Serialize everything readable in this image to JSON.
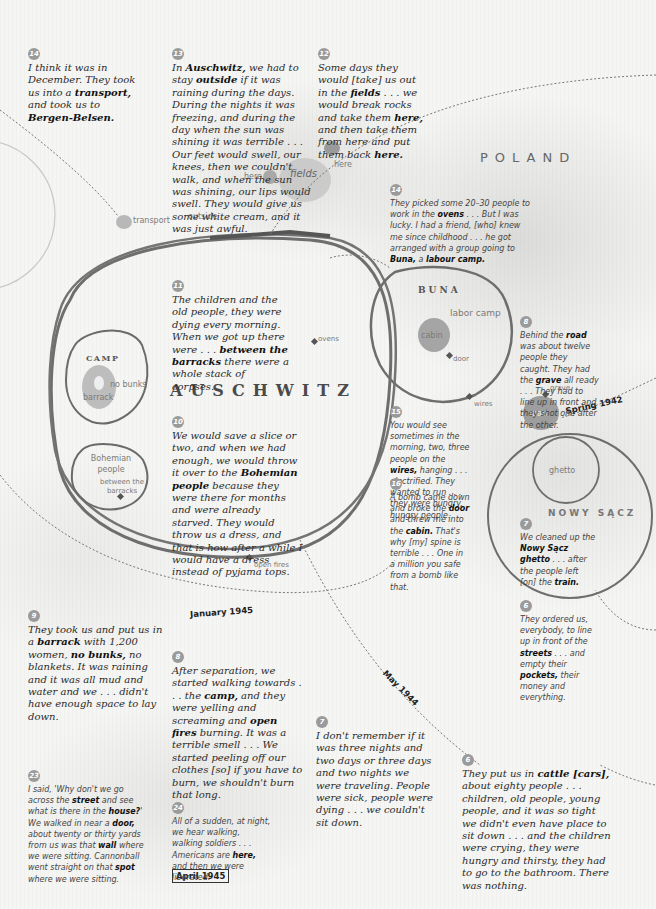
{
  "places": {
    "poland": "POLAND",
    "auschwitz": "AUSCHWITZ",
    "camp": "CAMP",
    "buna": "BUNA",
    "nowy_sacz": "NOWY SĄCZ"
  },
  "labels": {
    "transport": "transport",
    "outside": "outside",
    "here_1": "here",
    "here_2": "here",
    "fields": "fields",
    "labor_camp": "labor camp",
    "cabin": "cabin",
    "door": "door",
    "ovens": "ovens",
    "wires": "wires",
    "no_bunks": "no bunks",
    "barrack": "barrack",
    "bohemian_people": "Bohemian people",
    "between_the_barracks": "between the barracks",
    "open_fires": "open fires",
    "grave": "grave",
    "road": "road",
    "ghetto": "ghetto"
  },
  "dates": {
    "spring_1942": "Spring 1942",
    "may_1944": "May 1944",
    "january_1945": "January 1945",
    "april_1945": "April 1945"
  },
  "colors": {
    "background": "#f4f4f2",
    "ink": "#6e6e6e",
    "badge": "#9a9a9a",
    "text": "#2a2a2a"
  },
  "quotes": [
    {
      "id": "q14a",
      "number": "14",
      "style": "serif",
      "parts": [
        [
          "I think it was in December. They took us into a ",
          false
        ],
        [
          "transport,",
          true
        ],
        [
          " and took us to ",
          false
        ],
        [
          "Bergen-Belsen.",
          true
        ]
      ]
    },
    {
      "id": "q13",
      "number": "13",
      "style": "serif",
      "parts": [
        [
          "In ",
          false
        ],
        [
          "Auschwitz,",
          true
        ],
        [
          " we had to stay ",
          false
        ],
        [
          "outside",
          true
        ],
        [
          " if it was raining during the days. During the nights it was freezing, and during the day when the sun was shining it was terrible . . . Our feet would swell, our knees, then we couldn't walk, and when the sun was shining, our lips would swell. They would give us some white cream, and it was just awful.",
          false
        ]
      ]
    },
    {
      "id": "q12",
      "number": "12",
      "style": "serif",
      "parts": [
        [
          "Some days they would [take] us out in the ",
          false
        ],
        [
          "fields",
          true
        ],
        [
          " . . . we would break rocks and take them ",
          false
        ],
        [
          "here,",
          true
        ],
        [
          " and then take them from here and put them back ",
          false
        ],
        [
          "here.",
          true
        ]
      ]
    },
    {
      "id": "q14b",
      "number": "14",
      "style": "sans",
      "parts": [
        [
          "They picked some 20–30 people to work in the ",
          false
        ],
        [
          "ovens",
          true
        ],
        [
          " . . . But I was lucky. I had a friend, [who] knew me since childhood . . . he got arranged with a group going to ",
          false
        ],
        [
          "Buna,",
          true
        ],
        [
          " a ",
          false
        ],
        [
          "labour camp.",
          true
        ]
      ]
    },
    {
      "id": "q11",
      "number": "11",
      "style": "serif",
      "parts": [
        [
          "The children and the old people, they were dying every morning. When we got up there were . . . ",
          false
        ],
        [
          "between the barracks",
          true
        ],
        [
          " there were a whole stack of corpses.",
          false
        ]
      ]
    },
    {
      "id": "q8b",
      "number": "8",
      "style": "sans",
      "parts": [
        [
          "Behind the ",
          false
        ],
        [
          "road",
          true
        ],
        [
          " was about twelve people they caught. They had the ",
          false
        ],
        [
          "grave",
          true
        ],
        [
          " all ready . . . They had to line up in front and they shot one after the other.",
          false
        ]
      ]
    },
    {
      "id": "q10",
      "number": "10",
      "style": "serif",
      "parts": [
        [
          "We would save a slice or two, and when we had enough, we would throw it over to the ",
          false
        ],
        [
          "Bohemian people",
          true
        ],
        [
          " because they were there for months and were already starved. They would throw us a dress, and that is how after a while I would have a dress instead of pyjama tops.",
          false
        ]
      ]
    },
    {
      "id": "q15",
      "number": "15",
      "style": "sans",
      "parts": [
        [
          "You would see sometimes in the morning, two, three people on the ",
          false
        ],
        [
          "wires,",
          true
        ],
        [
          " hanging . . . electrified. They wanted to run . . . they were hungry, hungry people.",
          false
        ]
      ]
    },
    {
      "id": "q16",
      "number": "16",
      "style": "sans",
      "parts": [
        [
          "A bomb came down and broke the ",
          false
        ],
        [
          "door",
          true
        ],
        [
          " and threw me into the ",
          false
        ],
        [
          "cabin.",
          true
        ],
        [
          " That's why [my] spine is terrible . . . One in a million you safe from a bomb like that.",
          false
        ]
      ]
    },
    {
      "id": "q7b",
      "number": "7",
      "style": "sans",
      "parts": [
        [
          "We cleaned up the ",
          false
        ],
        [
          "Nowy Sącz ghetto",
          true
        ],
        [
          " . . . after the people left [on] the ",
          false
        ],
        [
          "train.",
          true
        ]
      ]
    },
    {
      "id": "q6b",
      "number": "6",
      "style": "sans",
      "parts": [
        [
          "They ordered us, everybody, to line up in front of the ",
          false
        ],
        [
          "streets",
          true
        ],
        [
          " . . . and empty their ",
          false
        ],
        [
          "pockets,",
          true
        ],
        [
          " their money and everything.",
          false
        ]
      ]
    },
    {
      "id": "q9",
      "number": "9",
      "style": "serif",
      "parts": [
        [
          "They took us and put us in a ",
          false
        ],
        [
          "barrack",
          true
        ],
        [
          " with 1,200 women, ",
          false
        ],
        [
          "no bunks,",
          true
        ],
        [
          " no blankets. It was raining and it was all mud and water and we . . . didn't have enough space to lay down.",
          false
        ]
      ]
    },
    {
      "id": "q8a",
      "number": "8",
      "style": "serif",
      "parts": [
        [
          "After separation, we started walking towards . . . the ",
          false
        ],
        [
          "camp,",
          true
        ],
        [
          " and they were yelling and screaming and ",
          false
        ],
        [
          "open fires",
          true
        ],
        [
          " burning. It was a terrible smell . . . We started peeling off our clothes [so] if you have to burn, we shouldn't burn that long.",
          false
        ]
      ]
    },
    {
      "id": "q7a",
      "number": "7",
      "style": "serif",
      "parts": [
        [
          "I don't remember if it was three nights and two days or three days and two nights we were traveling. People were sick, people were dying . . . we couldn't sit down.",
          false
        ]
      ]
    },
    {
      "id": "q6a",
      "number": "6",
      "style": "serif",
      "parts": [
        [
          "They put us in ",
          false
        ],
        [
          "cattle [cars],",
          true
        ],
        [
          " about eighty people . . . children, old people, young people, and it was so tight we didn't even have place to sit down . . . and the children were crying, they were hungry and thirsty, they had to go to the bathroom. There was nothing.",
          false
        ]
      ]
    },
    {
      "id": "q23",
      "number": "23",
      "style": "sans",
      "parts": [
        [
          "I said, 'Why don't we go across the ",
          false
        ],
        [
          "street",
          true
        ],
        [
          " and see what is there in the ",
          false
        ],
        [
          "house?",
          true
        ],
        [
          "' We walked in near a ",
          false
        ],
        [
          "door,",
          true
        ],
        [
          " about twenty or thirty yards from us was that ",
          false
        ],
        [
          "wall",
          true
        ],
        [
          " where we were sitting. Cannonball went straight on that ",
          false
        ],
        [
          "spot",
          true
        ],
        [
          " where we were sitting.",
          false
        ]
      ]
    },
    {
      "id": "q24",
      "number": "24",
      "style": "sans",
      "parts": [
        [
          "All of a sudden, at night, we hear walking, walking soldiers . . . Americans are ",
          false
        ],
        [
          "here,",
          true
        ],
        [
          " and then we were liberated.",
          false
        ]
      ]
    }
  ]
}
